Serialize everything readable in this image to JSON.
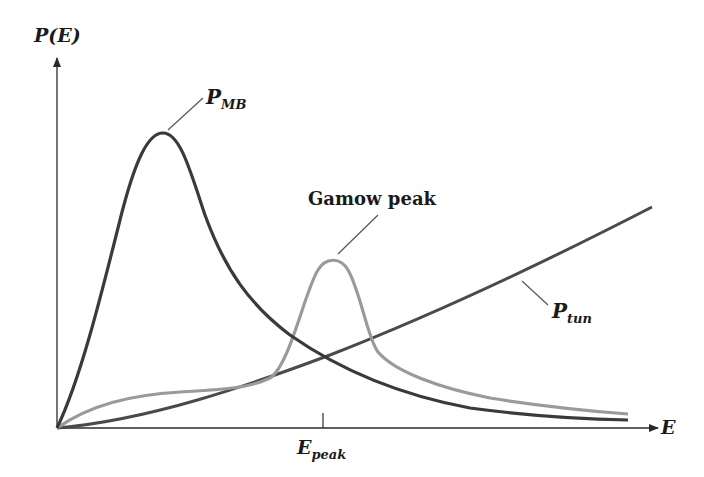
{
  "chart_data": {
    "type": "line",
    "title": "",
    "xlabel": "E",
    "ylabel": "P(E)",
    "grid": false,
    "legend": "none (inline labels)",
    "x_ticks": [
      {
        "label": "E_peak",
        "position_px": 323
      }
    ],
    "series": [
      {
        "name": "P_MB",
        "label_main": "P",
        "label_sub": "MB",
        "color": "#3a3a3a",
        "description": "Maxwell-Boltzmann distribution: rises steeply from origin, peaks early, then decays toward zero",
        "path": "M57,428 C80,380 100,300 120,220 C135,160 148,133 163,133 C180,133 190,170 205,215 C225,270 250,305 290,335 C340,370 400,395 470,408 C530,416 580,419 628,420"
      },
      {
        "name": "Gamow peak",
        "label_main": "Gamow peak",
        "color": "#9a9a9a",
        "description": "Product of P_MB and P_tun: low plateau, sharp peak at E_peak, then tails off",
        "path": "M57,428 C90,405 130,395 180,392 C220,390 250,388 270,378 C290,365 305,290 318,270 C325,258 340,256 348,270 C360,290 368,340 378,352 C395,372 440,388 490,398 C540,406 590,411 628,414"
      },
      {
        "name": "P_tun",
        "label_main": "P",
        "label_sub": "tun",
        "color": "#4a4a4a",
        "description": "Tunneling probability: starts at zero, rises monotonically",
        "path": "M57,428 C150,420 250,385 330,355 C420,320 520,275 652,207"
      }
    ],
    "annotations": [
      {
        "text": "P_MB",
        "target": "P_MB peak"
      },
      {
        "text": "Gamow peak",
        "target": "Gamow peak maximum"
      },
      {
        "text": "P_tun",
        "target": "P_tun curve"
      },
      {
        "text": "E_peak",
        "target": "x-axis tick under Gamow peak"
      }
    ]
  },
  "labels": {
    "y_axis": "P(E)",
    "x_axis": "E",
    "p_mb_main": "P",
    "p_mb_sub": "MB",
    "gamow": "Gamow peak",
    "p_tun_main": "P",
    "p_tun_sub": "tun",
    "e_peak_main": "E",
    "e_peak_sub": "peak"
  },
  "colors": {
    "axis": "#2a2a2a",
    "p_mb": "#3a3a3a",
    "gamow": "#9a9a9a",
    "p_tun": "#4a4a4a",
    "leader": "#555555"
  }
}
